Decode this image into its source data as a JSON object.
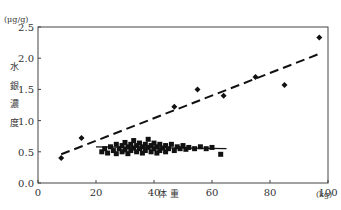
{
  "chart_data": {
    "type": "scatter",
    "title": "",
    "xlabel": "体 重",
    "xunit": "(kg)",
    "ylabel": "水銀濃度",
    "ylabel_chars": [
      "水",
      "銀",
      "濃",
      "度"
    ],
    "yunit": "(μg/g)",
    "xlim": [
      0,
      100
    ],
    "ylim": [
      0.0,
      2.5
    ],
    "xticks": [
      0,
      20,
      40,
      60,
      80,
      100
    ],
    "xtick_labels": [
      "0",
      "20",
      "40",
      "60",
      "80",
      "100"
    ],
    "yticks": [
      0.0,
      0.5,
      1.0,
      1.5,
      2.0,
      2.5
    ],
    "ytick_labels": [
      "0.0",
      "0.5",
      "1.0",
      "1.5",
      "2.0",
      "2.5"
    ],
    "grid": false,
    "legend": null,
    "series": [
      {
        "name": "diamond",
        "marker": "diamond",
        "points": [
          [
            8,
            0.4
          ],
          [
            15,
            0.72
          ],
          [
            47,
            1.22
          ],
          [
            55,
            1.5
          ],
          [
            64,
            1.4
          ],
          [
            75,
            1.7
          ],
          [
            85,
            1.57
          ],
          [
            97,
            2.33
          ]
        ],
        "trendline": {
          "style": "dashed",
          "from": [
            8,
            0.46
          ],
          "to": [
            97,
            2.07
          ]
        }
      },
      {
        "name": "square",
        "marker": "square",
        "points": [
          [
            22,
            0.5
          ],
          [
            23,
            0.55
          ],
          [
            24,
            0.48
          ],
          [
            25,
            0.58
          ],
          [
            26,
            0.52
          ],
          [
            27,
            0.62
          ],
          [
            27,
            0.47
          ],
          [
            28,
            0.55
          ],
          [
            29,
            0.6
          ],
          [
            29,
            0.5
          ],
          [
            30,
            0.65
          ],
          [
            30,
            0.53
          ],
          [
            31,
            0.58
          ],
          [
            31,
            0.47
          ],
          [
            32,
            0.62
          ],
          [
            32,
            0.52
          ],
          [
            33,
            0.56
          ],
          [
            33,
            0.68
          ],
          [
            34,
            0.5
          ],
          [
            34,
            0.6
          ],
          [
            35,
            0.55
          ],
          [
            35,
            0.64
          ],
          [
            36,
            0.48
          ],
          [
            36,
            0.58
          ],
          [
            37,
            0.62
          ],
          [
            37,
            0.52
          ],
          [
            38,
            0.57
          ],
          [
            38,
            0.7
          ],
          [
            39,
            0.5
          ],
          [
            39,
            0.6
          ],
          [
            40,
            0.55
          ],
          [
            40,
            0.64
          ],
          [
            41,
            0.48
          ],
          [
            41,
            0.58
          ],
          [
            42,
            0.62
          ],
          [
            42,
            0.52
          ],
          [
            43,
            0.56
          ],
          [
            44,
            0.6
          ],
          [
            44,
            0.5
          ],
          [
            45,
            0.55
          ],
          [
            46,
            0.62
          ],
          [
            47,
            0.52
          ],
          [
            48,
            0.58
          ],
          [
            49,
            0.55
          ],
          [
            50,
            0.6
          ],
          [
            51,
            0.54
          ],
          [
            52,
            0.57
          ],
          [
            54,
            0.55
          ],
          [
            56,
            0.58
          ],
          [
            58,
            0.55
          ],
          [
            60,
            0.57
          ],
          [
            63,
            0.46
          ]
        ],
        "trendline": {
          "style": "solid",
          "from": [
            20,
            0.58
          ],
          "to": [
            65,
            0.55
          ]
        }
      }
    ]
  }
}
